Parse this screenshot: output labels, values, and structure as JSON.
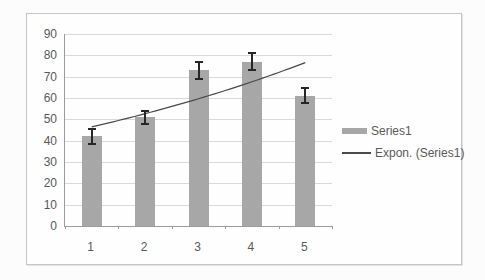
{
  "chart_data": {
    "type": "bar",
    "title": "",
    "xlabel": "",
    "ylabel": "",
    "categories": [
      "1",
      "2",
      "3",
      "4",
      "5"
    ],
    "series": [
      {
        "name": "Series1",
        "values": [
          42,
          51,
          73,
          77,
          61
        ],
        "error_bars": [
          3.5,
          3,
          4,
          4,
          3.5
        ],
        "color": "#a7a7a7"
      }
    ],
    "trendline": {
      "label": "Expon. (Series1)",
      "type": "exponential",
      "a": 41,
      "b": 0.125,
      "color": "#4a4a4a"
    },
    "ylim": [
      0,
      90
    ],
    "ytick_step": 10,
    "ytick_labels": [
      "0",
      "10",
      "20",
      "30",
      "40",
      "50",
      "60",
      "70",
      "80",
      "90"
    ],
    "grid": true,
    "legend_position": "right",
    "colors": {
      "bar": "#a7a7a7",
      "gridline": "#d9d9d9",
      "axis": "#9b9b9b",
      "error_bar": "#262626",
      "text": "#595959",
      "frame_border": "#c6c6c6",
      "plot_background": "#fefefe"
    }
  },
  "legend": {
    "items": [
      {
        "label": "Series1",
        "swatch": "bar-swatch"
      },
      {
        "label": "Expon. (Series1)",
        "swatch": "line-swatch"
      }
    ]
  }
}
